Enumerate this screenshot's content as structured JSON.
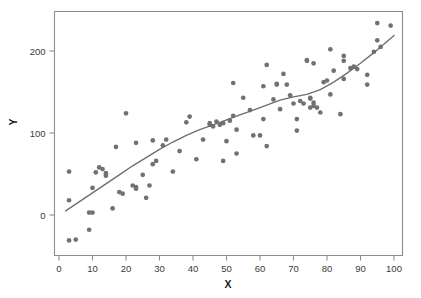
{
  "chart_data": {
    "type": "scatter",
    "title": "",
    "subtitle": "",
    "xlabel": "X",
    "ylabel": "Y",
    "xlim": [
      -2,
      104
    ],
    "ylim": [
      -48,
      248
    ],
    "grid": false,
    "legend": null,
    "xticks": [
      0,
      10,
      20,
      30,
      40,
      50,
      60,
      70,
      80,
      90,
      100
    ],
    "yticks": [
      0,
      100,
      200
    ],
    "xtick_labels": [
      "0",
      "10",
      "20",
      "30",
      "40",
      "50",
      "60",
      "70",
      "80",
      "90",
      "100"
    ],
    "ytick_labels": [
      "0",
      "100",
      "200"
    ],
    "point_color": "#717171",
    "line_color": "#6e6e6e",
    "frame_color": "#8d8d8d",
    "background_color": "#ffffff",
    "series": [
      {
        "name": "observations",
        "type": "scatter",
        "points": [
          [
            3,
            -31
          ],
          [
            3,
            18
          ],
          [
            3,
            53
          ],
          [
            5,
            -30
          ],
          [
            9,
            -18
          ],
          [
            9,
            3
          ],
          [
            10,
            3
          ],
          [
            10,
            33
          ],
          [
            11,
            52
          ],
          [
            12,
            58
          ],
          [
            13,
            56
          ],
          [
            14,
            48
          ],
          [
            14,
            51
          ],
          [
            16,
            8
          ],
          [
            17,
            83
          ],
          [
            18,
            28
          ],
          [
            19,
            26
          ],
          [
            20,
            124
          ],
          [
            22,
            36
          ],
          [
            23,
            32
          ],
          [
            23,
            34
          ],
          [
            23,
            88
          ],
          [
            25,
            49
          ],
          [
            26,
            21
          ],
          [
            27,
            36
          ],
          [
            28,
            62
          ],
          [
            28,
            91
          ],
          [
            29,
            66
          ],
          [
            31,
            85
          ],
          [
            32,
            92
          ],
          [
            34,
            53
          ],
          [
            36,
            78
          ],
          [
            38,
            113
          ],
          [
            39,
            120
          ],
          [
            41,
            68
          ],
          [
            43,
            92
          ],
          [
            45,
            110
          ],
          [
            45,
            112
          ],
          [
            46,
            108
          ],
          [
            47,
            114
          ],
          [
            48,
            110
          ],
          [
            49,
            112
          ],
          [
            49,
            66
          ],
          [
            50,
            90
          ],
          [
            51,
            115
          ],
          [
            52,
            161
          ],
          [
            52,
            121
          ],
          [
            53,
            75
          ],
          [
            53,
            104
          ],
          [
            55,
            143
          ],
          [
            57,
            128
          ],
          [
            58,
            97
          ],
          [
            60,
            97
          ],
          [
            61,
            117
          ],
          [
            61,
            157
          ],
          [
            62,
            183
          ],
          [
            62,
            84
          ],
          [
            64,
            141
          ],
          [
            65,
            159
          ],
          [
            65,
            160
          ],
          [
            66,
            129
          ],
          [
            67,
            172
          ],
          [
            68,
            159
          ],
          [
            69,
            146
          ],
          [
            70,
            136
          ],
          [
            71,
            103
          ],
          [
            71,
            117
          ],
          [
            72,
            139
          ],
          [
            73,
            136
          ],
          [
            74,
            188
          ],
          [
            74,
            189
          ],
          [
            75,
            131
          ],
          [
            75,
            143
          ],
          [
            75,
            142
          ],
          [
            76,
            133
          ],
          [
            76,
            137
          ],
          [
            76,
            185
          ],
          [
            77,
            131
          ],
          [
            78,
            125
          ],
          [
            79,
            162
          ],
          [
            80,
            164
          ],
          [
            81,
            147
          ],
          [
            81,
            202
          ],
          [
            82,
            176
          ],
          [
            84,
            123
          ],
          [
            85,
            166
          ],
          [
            85,
            188
          ],
          [
            85,
            194
          ],
          [
            87,
            179
          ],
          [
            88,
            181
          ],
          [
            89,
            178
          ],
          [
            92,
            159
          ],
          [
            92,
            171
          ],
          [
            94,
            199
          ],
          [
            95,
            213
          ],
          [
            95,
            234
          ],
          [
            96,
            205
          ],
          [
            99,
            231
          ]
        ]
      },
      {
        "name": "smoothed-trend",
        "type": "line",
        "points": [
          [
            2,
            5
          ],
          [
            6,
            16
          ],
          [
            10,
            27
          ],
          [
            14,
            38
          ],
          [
            18,
            49
          ],
          [
            22,
            60
          ],
          [
            26,
            70
          ],
          [
            30,
            80
          ],
          [
            34,
            89
          ],
          [
            38,
            97
          ],
          [
            42,
            104
          ],
          [
            46,
            110
          ],
          [
            50,
            116
          ],
          [
            54,
            122
          ],
          [
            58,
            128
          ],
          [
            62,
            134
          ],
          [
            66,
            140
          ],
          [
            70,
            144
          ],
          [
            74,
            147
          ],
          [
            78,
            153
          ],
          [
            82,
            162
          ],
          [
            86,
            173
          ],
          [
            90,
            185
          ],
          [
            94,
            198
          ],
          [
            98,
            212
          ],
          [
            100,
            219
          ]
        ]
      }
    ]
  },
  "axis": {
    "x_label": "X",
    "y_label": "Y"
  }
}
